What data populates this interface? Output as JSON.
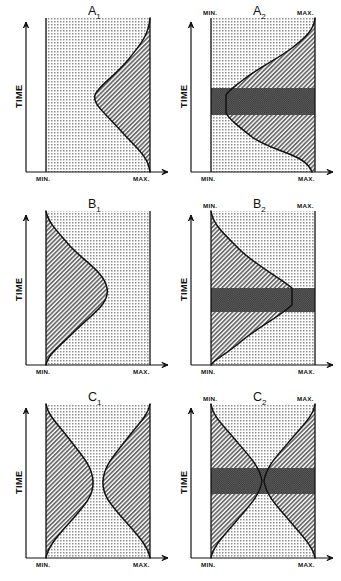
{
  "figure": {
    "type": "scientific-diagram",
    "axis": {
      "y_label": "TIME",
      "x_min_label": "MIN.",
      "x_max_label": "MAX."
    },
    "colors": {
      "ink": "#111111",
      "stipple": "#9a9a9a",
      "hatch": "#6e6e6e",
      "dark_band": "#4a4a4a",
      "background": "#ffffff"
    },
    "panels": [
      {
        "id": "A1",
        "title": "A",
        "subscript": "1",
        "row": 0,
        "col": 0,
        "has_top_labels": false,
        "has_dark_band": false,
        "shape": "single-bulge-right",
        "description": "Hatched region grows from the right edge; a single smooth bulge extends leftward toward MIN. at mid-time. Dotted stipple fills the remainder."
      },
      {
        "id": "A2",
        "title": "A",
        "subscript": "2",
        "row": 0,
        "col": 1,
        "has_top_labels": true,
        "has_dark_band": true,
        "shape": "single-bulge-right",
        "description": "Same as A1 but with MIN./MAX. labels repeated at the top and a dark checkerboard horizontal band across the mid-time interval where the curve touches MIN."
      },
      {
        "id": "B1",
        "title": "B",
        "subscript": "1",
        "row": 1,
        "col": 0,
        "has_top_labels": false,
        "has_dark_band": false,
        "shape": "single-bulge-left",
        "description": "Hatched region grows from the left edge; a single smooth bulge extends rightward toward MAX. at mid-time. Dotted stipple fills the remainder."
      },
      {
        "id": "B2",
        "title": "B",
        "subscript": "2",
        "row": 1,
        "col": 1,
        "has_top_labels": true,
        "has_dark_band": true,
        "shape": "single-bulge-left",
        "description": "Same as B1 but with MIN./MAX. labels repeated at the top and a dark checkerboard horizontal band across the mid-time interval where the curve reaches MAX."
      },
      {
        "id": "C1",
        "title": "C",
        "subscript": "1",
        "row": 2,
        "col": 0,
        "has_top_labels": false,
        "has_dark_band": false,
        "shape": "double-bulge-hourglass",
        "description": "Two hatched regions, one from each edge, each bulging inward at mid-time leaving a narrow dotted corridor between them."
      },
      {
        "id": "C2",
        "title": "C",
        "subscript": "2",
        "row": 2,
        "col": 1,
        "has_top_labels": true,
        "has_dark_band": true,
        "shape": "double-bulge-pinch",
        "description": "Two hatched regions from each edge meeting and pinching at the centre at mid-time, forming an hourglass; MIN./MAX. labels repeated at top and a dark checkerboard band across the pinch point."
      }
    ]
  }
}
